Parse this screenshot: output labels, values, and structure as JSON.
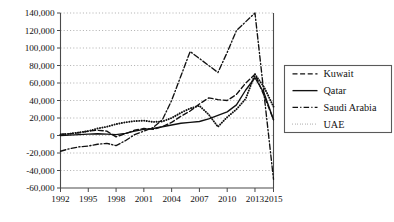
{
  "chart_data": {
    "type": "line",
    "title": "",
    "xlabel": "",
    "ylabel": "",
    "grid": true,
    "legend_position": "right",
    "x": [
      1992,
      1993,
      1994,
      1995,
      1996,
      1997,
      1998,
      1999,
      2000,
      2001,
      2002,
      2003,
      2004,
      2005,
      2006,
      2007,
      2008,
      2009,
      2010,
      2011,
      2012,
      2013,
      2014,
      2015
    ],
    "xticks": [
      1992,
      1995,
      1998,
      2001,
      2004,
      2007,
      2010,
      2013,
      2015
    ],
    "xtick_labels": [
      "1992",
      "1995",
      "1998",
      "2001",
      "2004",
      "2007",
      "2010",
      "2013",
      "2015"
    ],
    "yticks": [
      -60000,
      -40000,
      -20000,
      0,
      20000,
      40000,
      60000,
      80000,
      100000,
      120000,
      140000
    ],
    "ytick_labels": [
      "-60,000",
      "-40,000",
      "-20,000",
      "0",
      "20,000",
      "40,000",
      "60,000",
      "80,000",
      "100,000",
      "120,000",
      "140,000"
    ],
    "xlim": [
      1992,
      2015
    ],
    "ylim": [
      -60000,
      140000
    ],
    "series": [
      {
        "name": "Kuwait",
        "style": "dashed",
        "values": [
          1500,
          2000,
          3000,
          5000,
          6000,
          5000,
          -1500,
          2000,
          6000,
          8000,
          7000,
          10000,
          15000,
          22000,
          28000,
          36000,
          43000,
          41000,
          40000,
          47000,
          60000,
          70000,
          45000,
          18000
        ]
      },
      {
        "name": "Qatar",
        "style": "solid",
        "values": [
          0,
          500,
          1000,
          1500,
          2000,
          1500,
          1000,
          2500,
          5000,
          7000,
          8000,
          10000,
          12000,
          14000,
          15000,
          16000,
          19000,
          23000,
          27000,
          35000,
          52000,
          66000,
          48000,
          18000
        ]
      },
      {
        "name": "Saudi Arabia",
        "style": "dashdot",
        "values": [
          -18000,
          -15000,
          -13000,
          -12000,
          -10000,
          -9000,
          -11500,
          -6000,
          1000,
          5000,
          9000,
          18000,
          40000,
          68000,
          96000,
          88000,
          80000,
          72000,
          95000,
          120000,
          130000,
          140000,
          45000,
          -50000
        ]
      },
      {
        "name": "UAE",
        "style": "dotted",
        "values": [
          1000,
          2000,
          3500,
          5000,
          8000,
          10000,
          13000,
          15000,
          16500,
          17000,
          15500,
          16000,
          20000,
          26000,
          31000,
          34000,
          24000,
          10000,
          21000,
          30000,
          42000,
          70000,
          55000,
          33000
        ]
      }
    ]
  },
  "legend": {
    "items": [
      {
        "label": "Kuwait",
        "style": "dashed"
      },
      {
        "label": "Qatar",
        "style": "solid"
      },
      {
        "label": "Saudi Arabia",
        "style": "dashdot"
      },
      {
        "label": "UAE",
        "style": "dotted"
      }
    ]
  }
}
